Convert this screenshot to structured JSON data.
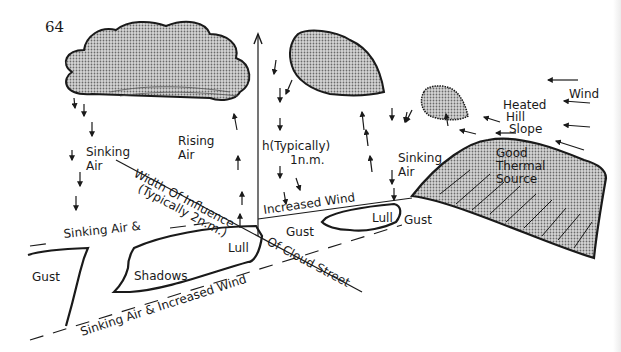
{
  "page_number": "64",
  "labels": {
    "sinking_air_left": [
      "Sinking",
      "Air"
    ],
    "rising_air": [
      "Rising",
      "Air"
    ],
    "height": [
      "h(Typically)",
      "1n.m."
    ],
    "sinking_air_right": [
      "Sinking",
      "Air"
    ],
    "good_thermal_source": [
      "Good",
      "Thermal",
      "Source"
    ],
    "heated_hill_slope": [
      "Heated",
      "Hill",
      "Slope"
    ],
    "wind": "Wind",
    "width_of_influence": "Width Of Influence",
    "typically_2nm": "(Typically 2n.m.)",
    "of_cloud_street": "Of Cloud Street",
    "increased_wind": "Increased Wind",
    "sinking_air_and": "Sinking Air &",
    "lull_left": "Lull",
    "lull_right": "Lull",
    "gust_center": "Gust",
    "gust_right": "Gust",
    "gust_left": "Gust",
    "shadows": "Shadows",
    "sinking_air_increased_wind": "Sinking Air & Increased Wind"
  },
  "colors": {
    "ink": "#1a1a1a",
    "cloud_fill": "#b8b8b8",
    "paper": "#ffffff"
  }
}
